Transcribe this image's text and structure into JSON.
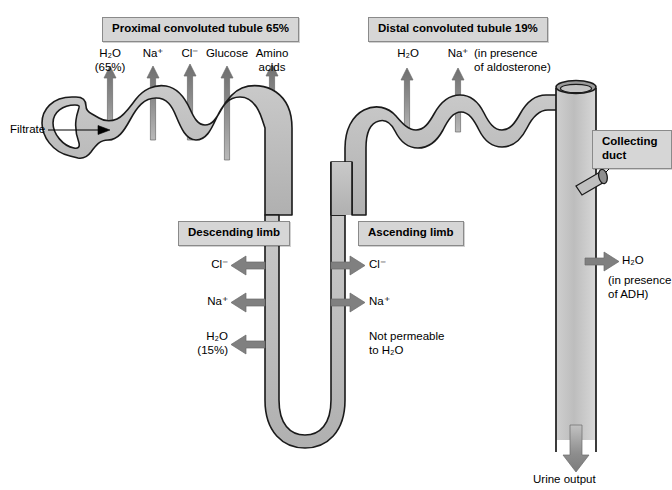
{
  "figure": {
    "background": "#ffffff",
    "tubule_fill": "#b8b8b8",
    "tubule_stroke": "#1a1a1a",
    "arrow_fill": "#808080",
    "label_box_fill": "#d6d6d6",
    "label_box_border": "#8a8a8a",
    "text_color": "#000000"
  },
  "sections": {
    "proximal": {
      "label": "Proximal convoluted tubule 65%",
      "solutes": [
        {
          "name": "H2O",
          "line1": "H₂O",
          "line2": "(65%)"
        },
        {
          "name": "Na",
          "line1": "Na⁺",
          "line2": ""
        },
        {
          "name": "Cl",
          "line1": "Cl⁻",
          "line2": ""
        },
        {
          "name": "Glucose",
          "line1": "Glucose",
          "line2": ""
        },
        {
          "name": "AminoAcids",
          "line1": "Amino",
          "line2": "acids"
        }
      ]
    },
    "distal": {
      "label": "Distal convoluted tubule 19%",
      "solutes": [
        {
          "name": "H2O",
          "line1": "H₂O",
          "line2": ""
        },
        {
          "name": "Na",
          "line1": "Na⁺",
          "line2": ""
        }
      ],
      "condition_line1": "(in presence",
      "condition_line2": "of aldosterone)"
    },
    "descending": {
      "label": "Descending limb",
      "items": [
        {
          "name": "Cl",
          "line1": "Cl⁻",
          "line2": ""
        },
        {
          "name": "Na",
          "line1": "Na⁺",
          "line2": ""
        },
        {
          "name": "H2O",
          "line1": "H₂O",
          "line2": "(15%)"
        }
      ]
    },
    "ascending": {
      "label": "Ascending limb",
      "items": [
        {
          "name": "Cl",
          "line1": "Cl⁻",
          "line2": ""
        },
        {
          "name": "Na",
          "line1": "Na⁺",
          "line2": ""
        }
      ],
      "note_line1": "Not permeable",
      "note_line2": "to H₂O"
    },
    "collecting_duct": {
      "label_line1": "Collecting",
      "label_line2": "duct",
      "water_label": "H₂O",
      "condition_line1": "(in presence",
      "condition_line2": "of ADH)",
      "output_label": "Urine output"
    }
  },
  "inlet": {
    "label": "Filtrate"
  }
}
